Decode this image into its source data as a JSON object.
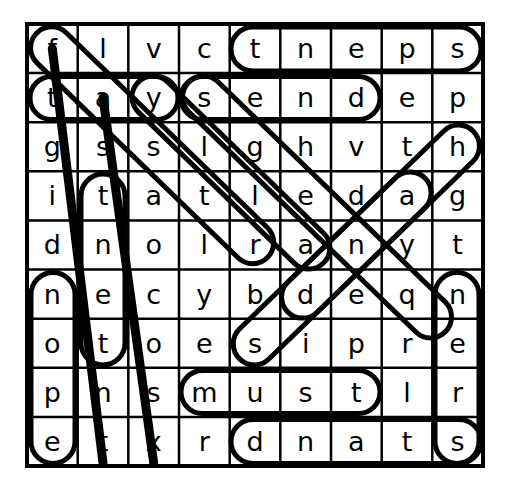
{
  "puzzle": {
    "type": "word-search",
    "rows": 9,
    "cols": 9,
    "grid": [
      [
        "f",
        "l",
        "v",
        "c",
        "t",
        "n",
        "e",
        "p",
        "s"
      ],
      [
        "t",
        "a",
        "y",
        "s",
        "e",
        "n",
        "d",
        "e",
        "p"
      ],
      [
        "g",
        "s",
        "s",
        "l",
        "g",
        "h",
        "v",
        "t",
        "h"
      ],
      [
        "i",
        "t",
        "a",
        "t",
        "l",
        "e",
        "d",
        "a",
        "g"
      ],
      [
        "d",
        "n",
        "o",
        "l",
        "r",
        "a",
        "n",
        "y",
        "t"
      ],
      [
        "n",
        "e",
        "c",
        "y",
        "b",
        "d",
        "e",
        "q",
        "n"
      ],
      [
        "o",
        "t",
        "o",
        "e",
        "s",
        "i",
        "p",
        "r",
        "e"
      ],
      [
        "p",
        "n",
        "s",
        "m",
        "u",
        "s",
        "t",
        "l",
        "r"
      ],
      [
        "e",
        "t",
        "x",
        "r",
        "d",
        "n",
        "a",
        "t",
        "s"
      ]
    ],
    "rows_text": [
      "f l v c t n e p s",
      "t a y s e n d e p",
      "g s s l g h v t h",
      "i t a t l e d a g",
      "d n o l r a n y t",
      "n e c y b d e q n",
      "o t o e s i p r e",
      "p n s m u s t l r",
      "e t x r d n a t s"
    ],
    "colors": {
      "grid_line": "#000000",
      "letter": "#000000",
      "marker": "#000000",
      "background": "#ffffff"
    },
    "found_words": [
      {
        "id": "tneps",
        "letters": "t n e p s",
        "direction": "horizontal",
        "row": 1,
        "from_col": 5,
        "to_col": 9,
        "marker": "oval"
      },
      {
        "id": "send",
        "letters": "s e n d",
        "direction": "horizontal",
        "row": 2,
        "from_col": 4,
        "to_col": 7,
        "marker": "oval"
      },
      {
        "id": "tay",
        "letters": "t a y",
        "direction": "horizontal",
        "row": 2,
        "from_col": 1,
        "to_col": 3,
        "marker": "oval"
      },
      {
        "id": "must",
        "letters": "m u s t",
        "direction": "horizontal",
        "row": 8,
        "from_col": 4,
        "to_col": 7,
        "marker": "oval"
      },
      {
        "id": "dnats",
        "letters": "d n a t s",
        "direction": "horizontal",
        "row": 9,
        "from_col": 5,
        "to_col": 9,
        "marker": "oval"
      },
      {
        "id": "tnet",
        "letters": "t n e t",
        "direction": "vertical",
        "col": 2,
        "from_row": 4,
        "to_row": 7,
        "marker": "oval"
      },
      {
        "id": "tner",
        "letters": "t n e r",
        "direction": "vertical",
        "col": 9,
        "from_row": 5,
        "to_row": 8,
        "marker": "oval"
      },
      {
        "id": "dnope",
        "letters": "d n o p e",
        "direction": "vertical",
        "col": 1,
        "from_row": 5,
        "to_row": 9,
        "marker": "oval"
      },
      {
        "id": "ftol",
        "letters": "f t s t l",
        "direction": "diagonal-down-right",
        "from_row": 1,
        "from_col": 1,
        "to_row": 5,
        "to_col": 5,
        "marker": "oval"
      },
      {
        "id": "yslde",
        "letters": "y s l e",
        "direction": "diagonal-down-right",
        "from_row": 2,
        "from_col": 3,
        "to_row": 5,
        "to_col": 6,
        "marker": "oval"
      },
      {
        "id": "sehdr",
        "letters": "s g d e r",
        "direction": "diagonal-down-right",
        "from_row": 2,
        "from_col": 4,
        "to_row": 7,
        "to_col": 8,
        "marker": "oval"
      },
      {
        "id": "ehvt",
        "letters": "e h a d",
        "direction": "diagonal-down-left",
        "from_row": 3,
        "from_col": 9,
        "to_row": 6,
        "to_col": 6,
        "marker": "oval"
      },
      {
        "id": "ebde",
        "letters": "e b d",
        "direction": "diagonal-up-right",
        "from_row": 6,
        "from_col": 5,
        "to_row": 2,
        "to_col": 8,
        "marker": "oval"
      },
      {
        "id": "strike-a",
        "letters": "",
        "direction": "diagonal-down-right",
        "from_row": 1,
        "from_col": 1,
        "to_row": 9,
        "to_col": 2,
        "marker": "line"
      },
      {
        "id": "strike-b",
        "letters": "",
        "direction": "diagonal-down-right",
        "from_row": 2,
        "from_col": 2,
        "to_row": 9,
        "to_col": 3,
        "marker": "line"
      }
    ]
  }
}
